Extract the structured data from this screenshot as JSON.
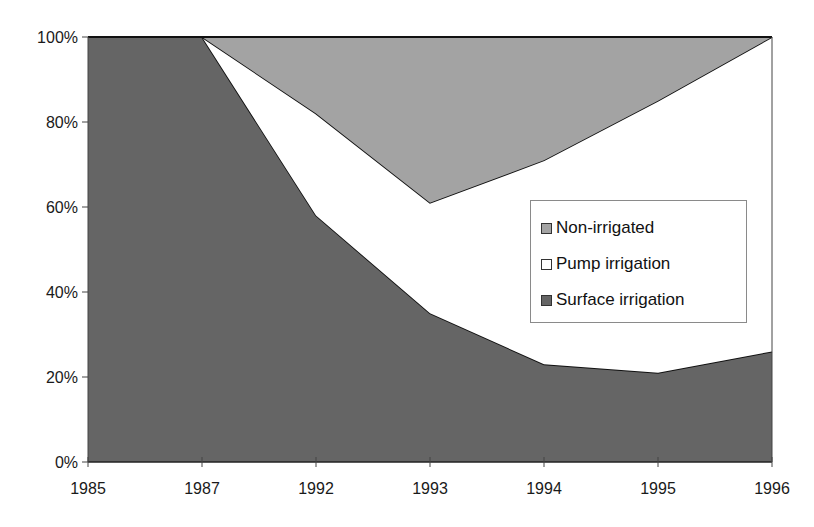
{
  "chart_data": {
    "type": "area",
    "stacked": true,
    "percent": true,
    "title": "",
    "xlabel": "",
    "ylabel": "",
    "categories": [
      "1985",
      "1987",
      "1992",
      "1993",
      "1994",
      "1995",
      "1996"
    ],
    "series": [
      {
        "name": "Surface irrigation",
        "values": [
          100,
          100,
          58,
          35,
          23,
          21,
          26
        ],
        "color": "#656565"
      },
      {
        "name": "Pump irrigation",
        "values": [
          0,
          0,
          24,
          26,
          48,
          64,
          74
        ],
        "color": "#ffffff"
      },
      {
        "name": "Non-irrigated",
        "values": [
          0,
          0,
          18,
          39,
          29,
          15,
          0
        ],
        "color": "#a3a3a3"
      }
    ],
    "ylim": [
      0,
      100
    ],
    "yticks": [
      "0%",
      "20%",
      "40%",
      "60%",
      "80%",
      "100%"
    ],
    "grid": false,
    "legend_position": "inside-right",
    "legend_order": [
      "Non-irrigated",
      "Pump irrigation",
      "Surface irrigation"
    ]
  },
  "legend": {
    "items": [
      {
        "label": "Non-irrigated",
        "color": "#a3a3a3"
      },
      {
        "label": "Pump irrigation",
        "color": "#ffffff"
      },
      {
        "label": "Surface irrigation",
        "color": "#656565"
      }
    ]
  }
}
